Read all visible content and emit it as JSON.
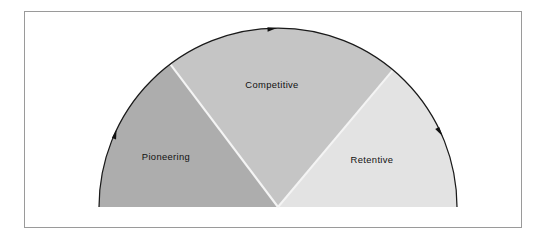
{
  "figure": {
    "frame": {
      "border_color": "#9a9a9a",
      "background_color": "#ffffff"
    },
    "geometry": {
      "center_x": 278,
      "center_y": 207,
      "radius": 179,
      "arc_start_deg": 180,
      "arc_end_deg": 0,
      "outline_color": "#1a1a1a"
    },
    "sectors": [
      {
        "id": "pioneering",
        "label": "Pioneering",
        "fill": "#adadad",
        "start_deg": 180,
        "end_deg": 127,
        "label_x": 166,
        "label_y": 158
      },
      {
        "id": "competitive",
        "label": "Competitive",
        "fill": "#c5c5c5",
        "start_deg": 127,
        "end_deg": 50,
        "label_x": 272,
        "label_y": 86
      },
      {
        "id": "retentive",
        "label": "Retentive",
        "fill": "#e3e3e3",
        "start_deg": 50,
        "end_deg": 0,
        "label_x": 372,
        "label_y": 161
      }
    ],
    "arrows": [
      {
        "id": "arrow-left-ascending",
        "direction": "clockwise",
        "angle_on_arc_deg": 156,
        "color": "#111111"
      },
      {
        "id": "arrow-top",
        "direction": "clockwise",
        "angle_on_arc_deg": 92,
        "color": "#111111"
      },
      {
        "id": "arrow-right-descending",
        "direction": "clockwise",
        "angle_on_arc_deg": 25,
        "color": "#111111"
      }
    ]
  },
  "chart_data": {
    "type": "pie",
    "title": "",
    "subtitle": "",
    "xlabel": "",
    "ylabel": "",
    "legend_position": "none",
    "grid": false,
    "shape": "semicircle",
    "total_degrees": 180,
    "direction": "clockwise",
    "categories": [
      "Pioneering",
      "Competitive",
      "Retentive"
    ],
    "values": [
      53,
      77,
      50
    ],
    "value_unit": "degrees",
    "colors": [
      "#adadad",
      "#c5c5c5",
      "#e3e3e3"
    ],
    "annotations": [
      "arrowhead at 156 deg on arc (clockwise)",
      "arrowhead at 92 deg on arc (clockwise)",
      "arrowhead at 25 deg on arc (clockwise)"
    ]
  }
}
